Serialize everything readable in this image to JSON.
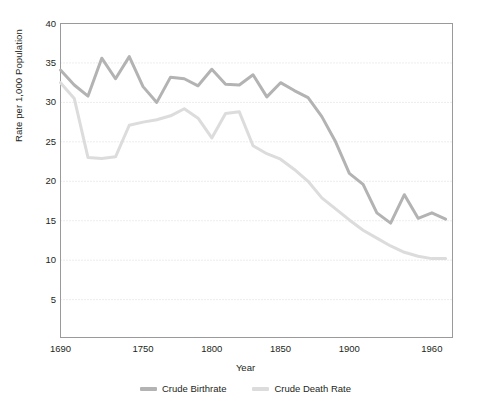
{
  "chart_data": {
    "type": "line",
    "title": "",
    "xlabel": "Year",
    "ylabel": "Rate per 1,000 Population",
    "xlim": [
      1690,
      1975
    ],
    "ylim": [
      0,
      40
    ],
    "grid": true,
    "legend_position": "bottom",
    "xticks": [
      1690,
      1750,
      1800,
      1850,
      1900,
      1960
    ],
    "xtick_labels": [
      "1690",
      "1750",
      "1800",
      "1850",
      "1900",
      "1960"
    ],
    "yticks": [
      5,
      10,
      15,
      20,
      25,
      30,
      35,
      40
    ],
    "ytick_labels": [
      "5",
      "10",
      "15",
      "20",
      "25",
      "30",
      "35",
      "40"
    ],
    "colors": {
      "crude_birthrate": "#b3b3b3",
      "crude_death_rate": "#dcdcdc",
      "axis": "#808080",
      "grid": "#d9d9d9",
      "text": "#231f20",
      "background": "#ffffff"
    },
    "series": [
      {
        "name": "Crude Birthrate",
        "color": "#b3b3b3",
        "x": [
          1690,
          1700,
          1710,
          1720,
          1730,
          1740,
          1750,
          1760,
          1770,
          1780,
          1790,
          1800,
          1810,
          1820,
          1830,
          1840,
          1850,
          1860,
          1870,
          1880,
          1890,
          1900,
          1910,
          1920,
          1930,
          1940,
          1950,
          1960,
          1970
        ],
        "values": [
          34.1,
          32.2,
          30.8,
          35.6,
          33.0,
          35.8,
          32.0,
          30.0,
          33.2,
          33.0,
          32.1,
          34.2,
          32.3,
          32.2,
          33.5,
          30.7,
          32.5,
          31.5,
          30.6,
          28.2,
          25.0,
          21.0,
          19.6,
          16.0,
          14.7,
          18.3,
          15.3,
          16.0,
          15.2
        ]
      },
      {
        "name": "Crude Death Rate",
        "color": "#dcdcdc",
        "x": [
          1690,
          1700,
          1710,
          1720,
          1730,
          1740,
          1750,
          1760,
          1770,
          1780,
          1790,
          1800,
          1810,
          1820,
          1830,
          1840,
          1850,
          1860,
          1870,
          1880,
          1890,
          1900,
          1910,
          1920,
          1930,
          1940,
          1950,
          1960,
          1970
        ],
        "values": [
          32.5,
          30.5,
          23.0,
          22.9,
          23.1,
          27.1,
          27.5,
          27.8,
          28.3,
          29.2,
          28.0,
          25.5,
          28.6,
          28.8,
          24.5,
          23.5,
          22.8,
          21.5,
          20.0,
          17.9,
          16.5,
          15.1,
          13.8,
          12.8,
          11.8,
          11.0,
          10.5,
          10.2,
          10.2
        ]
      }
    ]
  },
  "legend": {
    "items": [
      {
        "label": "Crude Birthrate",
        "color": "#b3b3b3"
      },
      {
        "label": "Crude Death Rate",
        "color": "#dcdcdc"
      }
    ]
  }
}
